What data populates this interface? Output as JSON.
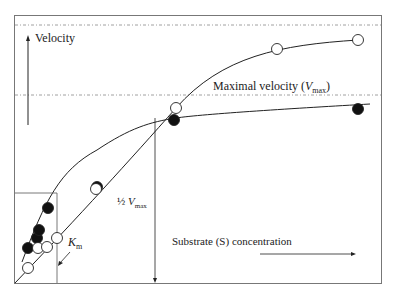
{
  "chart_data": {
    "type": "scatter",
    "ylabel": "Velocity",
    "xlabel": "Substrate (S) concentration",
    "annotations": {
      "vmax_label": "Maximal velocity (",
      "vmax_V": "V",
      "vmax_sub": "max",
      "vmax_close": ")",
      "half_label": "½ ",
      "half_V": "V",
      "half_sub": "max",
      "km_K": "K",
      "km_sub": "m"
    },
    "series": [
      {
        "name": "filled",
        "marker": "filled-circle",
        "points": [
          [
            28,
            248
          ],
          [
            37,
            238
          ],
          [
            39,
            230
          ],
          [
            48,
            208
          ],
          [
            97,
            187
          ],
          [
            174,
            120
          ],
          [
            358,
            109
          ]
        ]
      },
      {
        "name": "open",
        "marker": "open-circle",
        "points": [
          [
            28,
            268
          ],
          [
            38,
            248
          ],
          [
            47,
            247
          ],
          [
            57,
            238
          ],
          [
            96,
            189
          ],
          [
            176,
            108
          ],
          [
            277,
            49
          ],
          [
            358,
            40
          ]
        ]
      }
    ],
    "reference_lines": {
      "top_dashed_y": 25,
      "vmax_dashed_y": 95
    },
    "grid": false,
    "legend": "none"
  }
}
